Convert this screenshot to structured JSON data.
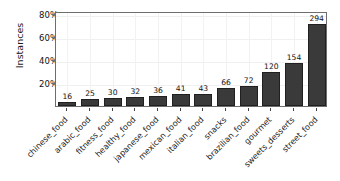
{
  "chart_data": {
    "type": "bar",
    "title": "",
    "xlabel": "",
    "ylabel": "Instances",
    "categories": [
      "chinese_food",
      "arabic_food",
      "fitness_food",
      "healthy_food",
      "japanese_food",
      "mexican_food",
      "italian_food",
      "snacks",
      "brazilian_food",
      "gourmet",
      "sweets_desserts",
      "street_food"
    ],
    "values": [
      16,
      25,
      30,
      32,
      36,
      41,
      43,
      66,
      72,
      120,
      154,
      294
    ],
    "value_labels": [
      "16",
      "25",
      "30",
      "32",
      "36",
      "41",
      "43",
      "66",
      "72",
      "120",
      "154",
      "294"
    ],
    "percentages": [
      3.9,
      6.1,
      7.3,
      7.8,
      8.7,
      10.0,
      10.4,
      16.0,
      17.5,
      29.1,
      37.4,
      71.4
    ],
    "ylim": [
      0,
      82.35
    ],
    "yticks": [
      20,
      40,
      60,
      80
    ],
    "ytick_labels": [
      "20%",
      "40%",
      "60%",
      "80%"
    ],
    "grid": true,
    "legend": null,
    "bar_color": "#3a3a3a",
    "bar_edge_color": "#202020",
    "axes_color": "#6e6e6e",
    "background": "#ffffff"
  }
}
